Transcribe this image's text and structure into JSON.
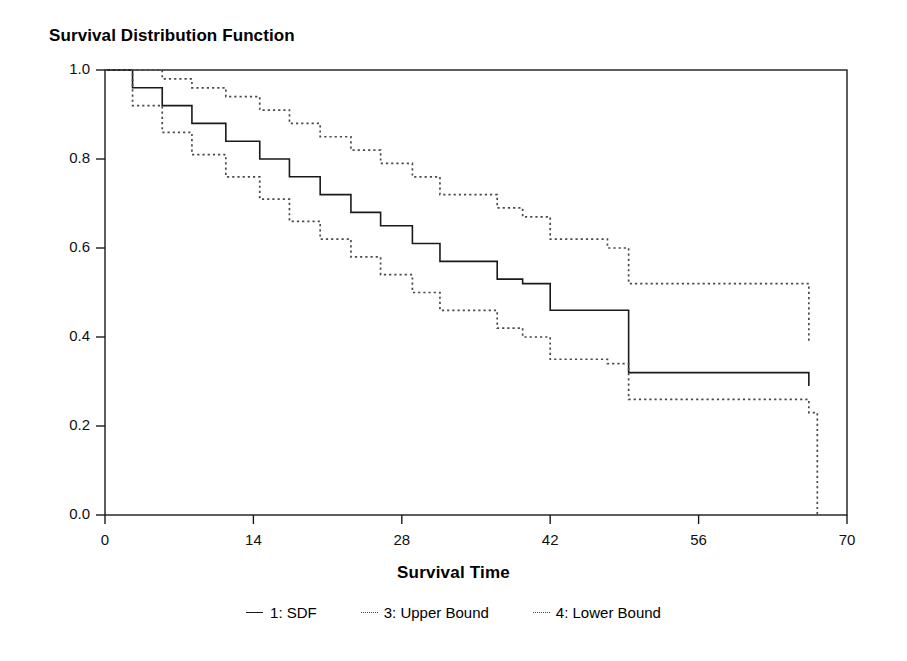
{
  "chart_data": {
    "type": "line",
    "title": "Survival Distribution Function",
    "xlabel": "Survival Time",
    "ylabel": "",
    "xlim": [
      0,
      70
    ],
    "ylim": [
      0.0,
      1.0
    ],
    "xticks": [
      0,
      14,
      28,
      42,
      56,
      70
    ],
    "xtick_labels": [
      "0",
      "14",
      "28",
      "42",
      "56",
      "70"
    ],
    "yticks": [
      0.0,
      0.2,
      0.4,
      0.6,
      0.8,
      1.0
    ],
    "ytick_labels": [
      "0.0",
      "0.2",
      "0.4",
      "0.6",
      "0.8",
      "1.0"
    ],
    "grid": false,
    "legend_position": "bottom",
    "step_style": "post",
    "series": [
      {
        "name": "1: SDF",
        "style": "solid",
        "color": "#1a1a1a",
        "x": [
          0,
          2.6,
          5.4,
          8.2,
          11.4,
          14.6,
          17.4,
          20.3,
          23.2,
          26.0,
          29.0,
          31.6,
          34.4,
          37.0,
          39.4,
          42.0,
          47.4,
          49.4,
          63.6,
          66.4
        ],
        "y": [
          1.0,
          0.96,
          0.92,
          0.88,
          0.84,
          0.8,
          0.76,
          0.72,
          0.68,
          0.65,
          0.61,
          0.57,
          0.57,
          0.53,
          0.52,
          0.46,
          0.46,
          0.32,
          0.32,
          0.29
        ]
      },
      {
        "name": "3: Upper Bound",
        "style": "dotted",
        "color": "#4a4a4a",
        "x": [
          0,
          2.6,
          5.4,
          8.2,
          11.4,
          14.6,
          17.4,
          20.3,
          23.2,
          26.0,
          29.0,
          31.6,
          34.4,
          37.0,
          39.4,
          42.0,
          47.4,
          49.4,
          63.6,
          66.4
        ],
        "y": [
          1.0,
          1.0,
          0.98,
          0.96,
          0.94,
          0.91,
          0.88,
          0.85,
          0.82,
          0.79,
          0.76,
          0.72,
          0.72,
          0.69,
          0.67,
          0.62,
          0.6,
          0.52,
          0.52,
          0.39
        ]
      },
      {
        "name": "4: Lower Bound",
        "style": "dotted",
        "color": "#4a4a4a",
        "x": [
          0,
          2.6,
          5.4,
          8.2,
          11.4,
          14.6,
          17.4,
          20.3,
          23.2,
          26.0,
          29.0,
          31.6,
          34.4,
          37.0,
          39.4,
          42.0,
          47.4,
          49.4,
          63.6,
          66.4,
          67.2
        ],
        "y": [
          1.0,
          0.92,
          0.86,
          0.81,
          0.76,
          0.71,
          0.66,
          0.62,
          0.58,
          0.54,
          0.5,
          0.46,
          0.46,
          0.42,
          0.4,
          0.35,
          0.34,
          0.26,
          0.26,
          0.23,
          0.0
        ]
      }
    ]
  },
  "legend": {
    "entries": [
      {
        "label": "1: SDF",
        "marker": "solid-line-swatch"
      },
      {
        "label": "3: Upper Bound",
        "marker": "dotted-line-swatch"
      },
      {
        "label": "4: Lower Bound",
        "marker": "dotted-line-swatch"
      }
    ]
  }
}
